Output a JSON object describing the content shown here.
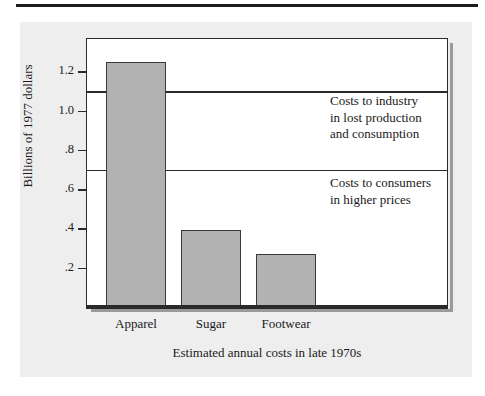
{
  "figure": {
    "background_color": "#eeeeee",
    "plot_background_color": "#ffffff",
    "bar_fill_color": "#b2b2b2",
    "line_color": "#2a2a2a"
  },
  "chart_data": {
    "type": "bar",
    "title": "",
    "subtitle": "",
    "xlabel": "Estimated annual costs in late 1970s",
    "ylabel": "Billions of 1977 dollars",
    "categories": [
      "Apparel",
      "Sugar",
      "Footwear"
    ],
    "values": [
      1.25,
      0.39,
      0.27
    ],
    "ylim": [
      0,
      1.37
    ],
    "yticks": [
      0.2,
      0.4,
      0.6,
      0.8,
      1.0,
      1.2
    ],
    "ytick_labels": [
      ".2",
      ".4",
      ".6",
      ".8",
      "1.0",
      "1.2"
    ],
    "grid": false,
    "legend": "none",
    "reference_lines": [
      {
        "value": 1.1,
        "label": "Costs to industry\nin lost production\nand consumption"
      },
      {
        "value": 0.7,
        "label": "Costs to consumers\nin higher prices"
      }
    ],
    "annotations": [
      {
        "id": "industry",
        "line1": "Costs to industry",
        "line2": "in lost production",
        "line3": "and consumption"
      },
      {
        "id": "consumers",
        "line1": "Costs to consumers",
        "line2": "in higher prices",
        "line3": ""
      }
    ]
  }
}
